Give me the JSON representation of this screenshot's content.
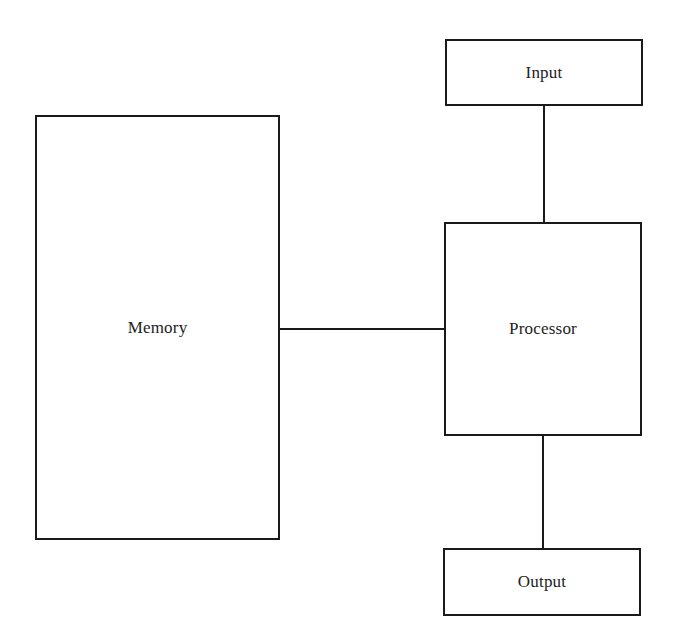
{
  "diagram": {
    "type": "block-diagram",
    "nodes": [
      {
        "id": "memory",
        "label": "Memory"
      },
      {
        "id": "processor",
        "label": "Processor"
      },
      {
        "id": "input",
        "label": "Input"
      },
      {
        "id": "output",
        "label": "Output"
      }
    ],
    "edges": [
      {
        "from": "memory",
        "to": "processor"
      },
      {
        "from": "input",
        "to": "processor"
      },
      {
        "from": "processor",
        "to": "output"
      }
    ],
    "colors": {
      "stroke": "#1a1a1a",
      "text": "#222222",
      "background": "#ffffff"
    }
  }
}
